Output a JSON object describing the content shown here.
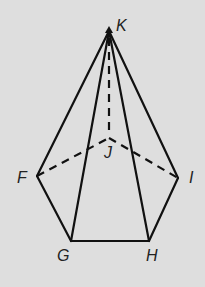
{
  "diagram": {
    "type": "pentagonal-pyramid",
    "background": "#dedede",
    "stroke": "#111111",
    "vertices": {
      "K": {
        "label": "K",
        "x": 109,
        "y": 31
      },
      "J": {
        "label": "J",
        "x": 109,
        "y": 138
      },
      "F": {
        "label": "F",
        "x": 37,
        "y": 176
      },
      "G": {
        "label": "G",
        "x": 71,
        "y": 241
      },
      "H": {
        "label": "H",
        "x": 149,
        "y": 241
      },
      "I": {
        "label": "I",
        "x": 178,
        "y": 178
      }
    },
    "solid_edges": [
      [
        "K",
        "F"
      ],
      [
        "K",
        "G"
      ],
      [
        "K",
        "H"
      ],
      [
        "K",
        "I"
      ],
      [
        "F",
        "G"
      ],
      [
        "G",
        "H"
      ],
      [
        "H",
        "I"
      ]
    ],
    "dashed_edges": [
      [
        "K",
        "J"
      ],
      [
        "F",
        "J"
      ],
      [
        "J",
        "I"
      ]
    ]
  }
}
